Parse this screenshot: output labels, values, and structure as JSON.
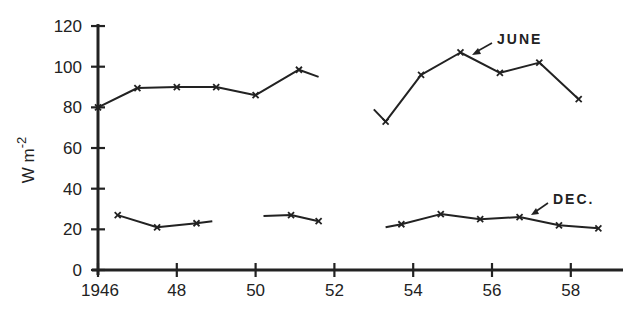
{
  "chart_data": {
    "type": "line",
    "title": "",
    "xlabel": "",
    "ylabel": "W m-2",
    "ylabel_main": "W m",
    "ylabel_sup": "-2",
    "xlim": [
      1946,
      1959.3
    ],
    "ylim": [
      0,
      120
    ],
    "x_ticks": [
      1946,
      1948,
      1950,
      1952,
      1954,
      1956,
      1958
    ],
    "x_tick_labels": [
      "1946",
      "48",
      "50",
      "52",
      "54",
      "56",
      "58"
    ],
    "y_ticks": [
      0,
      20,
      40,
      60,
      80,
      100,
      120
    ],
    "y_tick_labels": [
      "0",
      "20",
      "40",
      "60",
      "80",
      "100",
      "120"
    ],
    "grid": false,
    "legend": "none (direct annotations with arrows)",
    "series": [
      {
        "name": "JUNE",
        "segments": [
          {
            "points": [
              [
                1946.0,
                80
              ],
              [
                1947.0,
                89.5
              ],
              [
                1948.0,
                90
              ],
              [
                1949.0,
                90
              ],
              [
                1950.0,
                86
              ],
              [
                1951.1,
                98.5
              ]
            ],
            "line_end": [
              1951.6,
              95
            ]
          },
          {
            "line_start": [
              1953.0,
              79
            ],
            "points": [
              [
                1953.3,
                73
              ],
              [
                1954.2,
                96
              ],
              [
                1955.2,
                107
              ],
              [
                1956.2,
                97
              ],
              [
                1957.2,
                102
              ],
              [
                1958.2,
                84
              ]
            ]
          }
        ]
      },
      {
        "name": "DEC.",
        "segments": [
          {
            "points": [
              [
                1946.5,
                27
              ],
              [
                1947.5,
                21
              ],
              [
                1948.5,
                23
              ]
            ],
            "line_end": [
              1948.9,
              24
            ]
          },
          {
            "line_start": [
              1950.2,
              26.5
            ],
            "points": [
              [
                1950.9,
                27
              ],
              [
                1951.6,
                24
              ]
            ]
          },
          {
            "line_start": [
              1953.3,
              21
            ],
            "points": [
              [
                1953.7,
                22.5
              ],
              [
                1954.7,
                27.5
              ],
              [
                1955.7,
                25
              ],
              [
                1956.7,
                26
              ],
              [
                1957.7,
                22
              ],
              [
                1958.7,
                20.5
              ]
            ]
          }
        ]
      }
    ],
    "annotations": [
      {
        "text": "JUNE",
        "label_at": [
          1956.1,
          113
        ],
        "arrow_to": [
          1955.4,
          107.5
        ]
      },
      {
        "text": "DEC.",
        "label_at": [
          1957.8,
          34
        ],
        "arrow_to": [
          1957.2,
          27
        ]
      }
    ]
  },
  "labels": {
    "june": "JUNE",
    "dec": "DEC.",
    "ylabel_main": "W m",
    "ylabel_sup": "-2"
  },
  "colors": {
    "ink": "#222222",
    "background": "#ffffff"
  }
}
